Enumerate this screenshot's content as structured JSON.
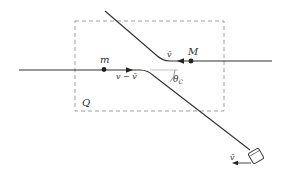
{
  "diagram": {
    "region_label": "Q",
    "particle_small": {
      "label": "m"
    },
    "particle_large": {
      "label": "M"
    },
    "velocity_incoming_label": "v − v̄",
    "velocity_large_label": "v̄",
    "angle_label": "θ",
    "angle_subscript": "C",
    "observer_velocity_label": "v̄",
    "colors": {
      "line": "#333333",
      "dashed_box": "#888888",
      "background": "#ffffff"
    }
  }
}
